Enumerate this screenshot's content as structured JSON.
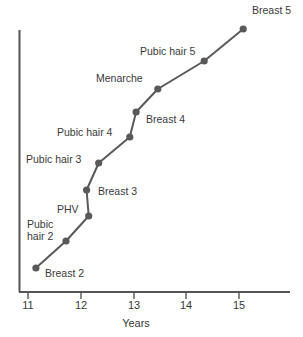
{
  "chart_data": {
    "type": "line",
    "title": "",
    "subtitle": "",
    "xlabel": "Years",
    "ylabel": "",
    "xlim": [
      10.85,
      15.6
    ],
    "ylim": [
      0,
      10
    ],
    "grid": false,
    "legend": null,
    "xticks": [
      11,
      12,
      13,
      14,
      15
    ],
    "xtick_labels": [
      "11",
      "12",
      "13",
      "14",
      "15"
    ],
    "yticks": [],
    "ytick_labels": [],
    "line_color": "#595959",
    "marker_color": "#595959",
    "axis_color": "#555555",
    "text_color": "#3a3a3a",
    "series": [
      {
        "name": "Pubertal milestones",
        "points": [
          {
            "label": "Breast 2",
            "x": 11.15,
            "y": 1
          },
          {
            "label": "Pubic hair 2",
            "x": 11.72,
            "y": 2
          },
          {
            "label": "PHV",
            "x": 12.15,
            "y": 3
          },
          {
            "label": "Breast 3",
            "x": 12.11,
            "y": 4
          },
          {
            "label": "Pubic hair 3",
            "x": 12.34,
            "y": 5
          },
          {
            "label": "Pubic hair 4",
            "x": 12.93,
            "y": 6
          },
          {
            "label": "Breast 4",
            "x": 13.05,
            "y": 7
          },
          {
            "label": "Menarche",
            "x": 13.46,
            "y": 8
          },
          {
            "label": "Pubic hair 5",
            "x": 14.34,
            "y": 9
          },
          {
            "label": "Breast 5",
            "x": 15.08,
            "y": 10
          }
        ]
      }
    ],
    "annotations": [
      {
        "text": "Breast 5",
        "px": 252,
        "py": 14
      },
      {
        "text": "Pubic hair 5",
        "px": 140,
        "py": 55
      },
      {
        "text": "Menarche",
        "px": 96,
        "py": 82
      },
      {
        "text": "Breast 4",
        "px": 146,
        "py": 123
      },
      {
        "text": "Pubic hair 4",
        "px": 57,
        "py": 136
      },
      {
        "text": "Pubic hair 3",
        "px": 26,
        "py": 163
      },
      {
        "text": "Breast 3",
        "px": 98,
        "py": 195
      },
      {
        "text": "PHV",
        "px": 57,
        "py": 213
      },
      {
        "text": "Pubic",
        "px": 27,
        "py": 228
      },
      {
        "text": "hair 2",
        "px": 27,
        "py": 240
      },
      {
        "text": "Breast 2",
        "px": 45,
        "py": 277
      }
    ]
  },
  "axis": {
    "x_title": "Years",
    "tick_11": "11",
    "tick_12": "12",
    "tick_13": "13",
    "tick_14": "14",
    "tick_15": "15"
  }
}
